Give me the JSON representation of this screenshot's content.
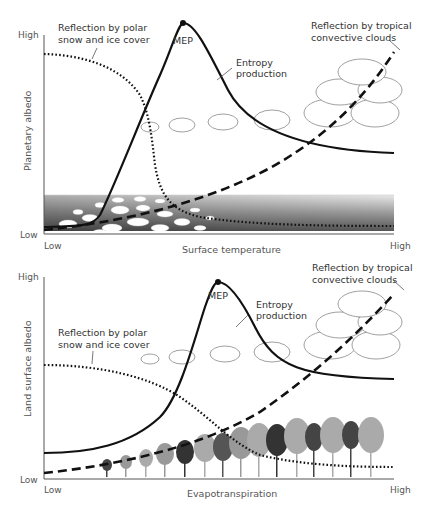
{
  "panels": [
    {
      "id": "top",
      "ylabel": "Planetary albedo",
      "xlabel": "Surface temperature",
      "y_high": "High",
      "y_low": "Low",
      "x_low": "Low",
      "x_high": "High",
      "annotations": {
        "polar_line1": "Reflection by polar",
        "polar_line2": "snow and ice cover",
        "mep": "MEP",
        "entropy_line1": "Entropy",
        "entropy_line2": "production",
        "tropical_line1": "Reflection by tropical",
        "tropical_line2": "convective clouds"
      },
      "background_illustration": "sea ice floes on gradient ocean"
    },
    {
      "id": "bottom",
      "ylabel": "Land surface albedo",
      "xlabel": "Evapotranspiration",
      "y_high": "High",
      "y_low": "Low",
      "x_low": "Low",
      "x_high": "High",
      "annotations": {
        "polar_line1": "Reflection by polar",
        "polar_line2": "snow and ice cover",
        "mep": "MEP",
        "entropy_line1": "Entropy",
        "entropy_line2": "production",
        "tropical_line1": "Reflection by tropical",
        "tropical_line2": "convective clouds"
      },
      "background_illustration": "row of trees increasing in size"
    }
  ],
  "legend_styles": {
    "polar_ice": "dotted",
    "entropy_production": "solid",
    "tropical_clouds": "dashed"
  },
  "colors": {
    "line": "#111111",
    "axis": "#555555",
    "text": "#333333"
  }
}
